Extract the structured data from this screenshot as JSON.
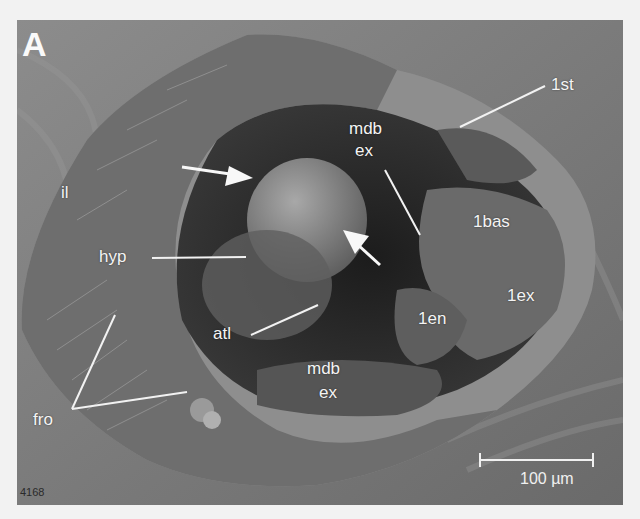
{
  "figure": {
    "panel_letter": "A",
    "image_id": "4168",
    "scale_bar": {
      "label": "100 µm"
    },
    "labels": [
      {
        "id": "il",
        "text": "il"
      },
      {
        "id": "hyp",
        "text": "hyp"
      },
      {
        "id": "atl",
        "text": "atl"
      },
      {
        "id": "fro",
        "text": "fro"
      },
      {
        "id": "mdb-ex-top-1",
        "text": "mdb"
      },
      {
        "id": "mdb-ex-top-2",
        "text": "ex"
      },
      {
        "id": "mdb-ex-bot-1",
        "text": "mdb"
      },
      {
        "id": "mdb-ex-bot-2",
        "text": "ex"
      },
      {
        "id": "1st",
        "text": "1st"
      },
      {
        "id": "1bas",
        "text": "1bas"
      },
      {
        "id": "1ex",
        "text": "1ex"
      },
      {
        "id": "1en",
        "text": "1en"
      }
    ],
    "colors": {
      "background": "#7a7a7a",
      "annotation": "#f4f4f4"
    }
  }
}
